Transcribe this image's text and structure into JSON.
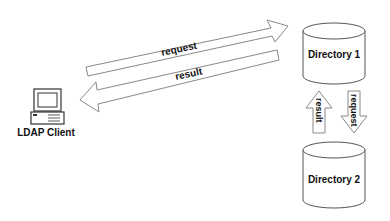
{
  "diagram": {
    "client": {
      "label": "LDAP Client",
      "icon": "computer-icon"
    },
    "directories": [
      {
        "label": "Directory 1"
      },
      {
        "label": "Directory 2"
      }
    ],
    "arrows": {
      "client_to_dir1": "request",
      "dir1_to_client": "result",
      "dir2_to_dir1": "result",
      "dir1_to_dir2": "request"
    },
    "colors": {
      "stroke": "#777777",
      "text": "#111111",
      "background": "#ffffff"
    }
  }
}
